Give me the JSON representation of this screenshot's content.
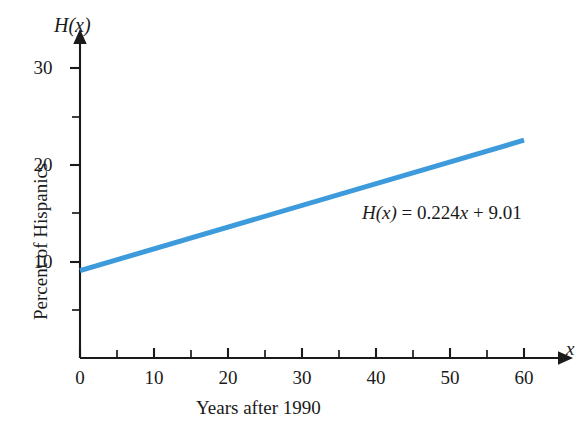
{
  "chart_data": {
    "type": "line",
    "title": "",
    "subtitle": "",
    "xlabel": "Years after 1990",
    "ylabel": "Percent of Hispanics",
    "x_axis_variable": "x",
    "y_axis_variable": "H(x)",
    "xlim": [
      0,
      63
    ],
    "ylim": [
      0,
      32
    ],
    "grid": false,
    "legend": "none",
    "x_ticks_major": [
      0,
      10,
      20,
      30,
      40,
      50,
      60
    ],
    "x_ticks_minor": [
      5,
      15,
      25,
      35,
      45,
      55
    ],
    "x_tick_labels": [
      "0",
      "10",
      "20",
      "30",
      "40",
      "50",
      "60"
    ],
    "y_ticks_major": [
      10,
      20,
      30
    ],
    "y_ticks_minor": [
      5,
      15,
      25
    ],
    "y_tick_labels": [
      "10",
      "20",
      "30"
    ],
    "series": [
      {
        "name": "H(x) = 0.224x + 9.01",
        "color": "#3d9bdc",
        "slope": 0.224,
        "intercept": 9.01,
        "x": [
          0,
          60
        ],
        "values": [
          9.01,
          22.45
        ]
      }
    ],
    "annotations": [
      {
        "name": "equation-label",
        "text": "H(x) = 0.224x + 9.01",
        "parts": {
          "fn": "H",
          "arg": "(x)",
          "eq": " = 0.224",
          "var": "x",
          "tail": " + 9.01"
        },
        "x": 45,
        "y": 15.5
      }
    ]
  },
  "axes": {
    "y_title_text": "H(x)",
    "y_title_fn": "H",
    "y_title_arg": "(x)",
    "x_title_text": "x",
    "x_caption": "Years after 1990",
    "y_caption": "Percent of Hispanics"
  },
  "colors": {
    "line": "#3d9bdc",
    "axis": "#1a1a1a",
    "text": "#1a1a1a",
    "background": "#ffffff"
  },
  "ticks": {
    "x": [
      "0",
      "10",
      "20",
      "30",
      "40",
      "50",
      "60"
    ],
    "y": [
      "10",
      "20",
      "30"
    ]
  }
}
